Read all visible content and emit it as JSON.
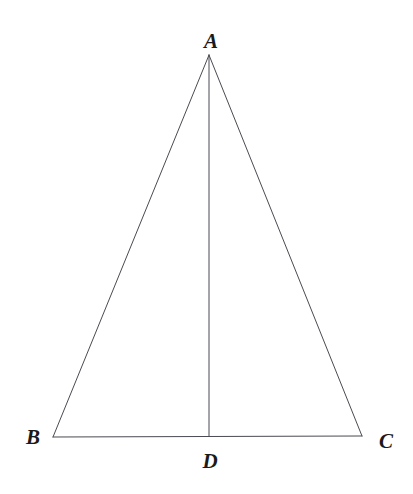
{
  "figure": {
    "kind": "geometry-diagram",
    "shape": "isosceles-triangle-with-altitude",
    "background_color": "#ffffff",
    "stroke_color": "#4a4a52",
    "stroke_width": 1,
    "canvas": {
      "width": 413,
      "height": 494
    },
    "labels": {
      "apex": "A",
      "base_left": "B",
      "base_right": "C",
      "foot": "D"
    },
    "points": {
      "A": {
        "x": 209,
        "y": 55
      },
      "B": {
        "x": 53,
        "y": 437
      },
      "C": {
        "x": 362,
        "y": 436
      },
      "D": {
        "x": 209,
        "y": 436
      }
    },
    "segments": [
      {
        "name": "AB",
        "from": "A",
        "to": "B"
      },
      {
        "name": "AC",
        "from": "A",
        "to": "C"
      },
      {
        "name": "BC",
        "from": "B",
        "to": "C"
      },
      {
        "name": "AD",
        "from": "A",
        "to": "D"
      }
    ],
    "label_positions": {
      "A": {
        "x": 211,
        "y": 41
      },
      "B": {
        "x": 33,
        "y": 437
      },
      "C": {
        "x": 386,
        "y": 441
      },
      "D": {
        "x": 210,
        "y": 461
      }
    }
  }
}
